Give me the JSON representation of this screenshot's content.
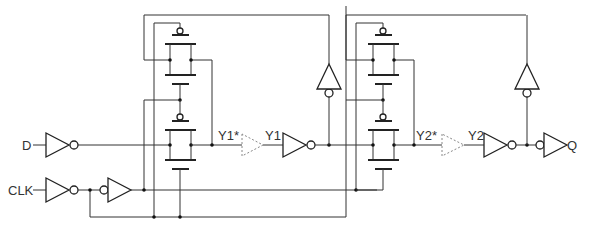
{
  "diagram": {
    "type": "circuit-schematic",
    "inputs": {
      "d": "D",
      "clk": "CLK"
    },
    "output": {
      "q": "Q"
    },
    "nodes": {
      "y1_star": "Y1*",
      "y1": "Y1",
      "y2_star": "Y2*",
      "y2": "Y2"
    },
    "components": [
      {
        "id": "inv-d",
        "kind": "inverter",
        "input": "D"
      },
      {
        "id": "inv-clk-1",
        "kind": "inverter",
        "input": "CLK"
      },
      {
        "id": "buf-clk-2",
        "kind": "inverter (input bubble)",
        "input": "CLK_b"
      },
      {
        "id": "tg-master-fb",
        "kind": "transmission-gate",
        "stage": "master feedback"
      },
      {
        "id": "tg-master-in",
        "kind": "transmission-gate",
        "stage": "master input"
      },
      {
        "id": "buf-y1-delay",
        "kind": "buffer (dashed, delay)",
        "from": "Y1*",
        "to": "Y1"
      },
      {
        "id": "inv-y1",
        "kind": "inverter",
        "input": "Y1"
      },
      {
        "id": "inv-master-fb",
        "kind": "feedback inverter",
        "stage": "master"
      },
      {
        "id": "tg-slave-fb",
        "kind": "transmission-gate",
        "stage": "slave feedback"
      },
      {
        "id": "tg-slave-in",
        "kind": "transmission-gate",
        "stage": "slave input"
      },
      {
        "id": "buf-y2-delay",
        "kind": "buffer (dashed, delay)",
        "from": "Y2*",
        "to": "Y2"
      },
      {
        "id": "inv-y2",
        "kind": "inverter",
        "input": "Y2"
      },
      {
        "id": "inv-slave-fb",
        "kind": "feedback inverter",
        "stage": "slave"
      },
      {
        "id": "inv-out",
        "kind": "inverter (input bubble)",
        "output": "Q"
      }
    ]
  }
}
